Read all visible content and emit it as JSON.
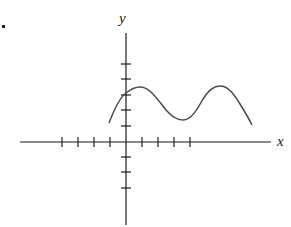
{
  "diagram": {
    "bullet_marker": "•",
    "axes": {
      "x_label": "x",
      "y_label": "y",
      "x_ticks_left": 4,
      "x_ticks_right": 4,
      "y_ticks_above": 5,
      "y_ticks_below": 3
    },
    "curve": {
      "shape": "wave",
      "features": [
        "starts below-left of y-axis",
        "crosses y-axis at 3rd tick",
        "local max near x=1",
        "local min near x=3.5",
        "local max near x=6",
        "descends toward right end"
      ]
    },
    "colors": {
      "axis": "#1a1a1a",
      "curve": "#4a4a4a",
      "background": "#ffffff"
    }
  }
}
